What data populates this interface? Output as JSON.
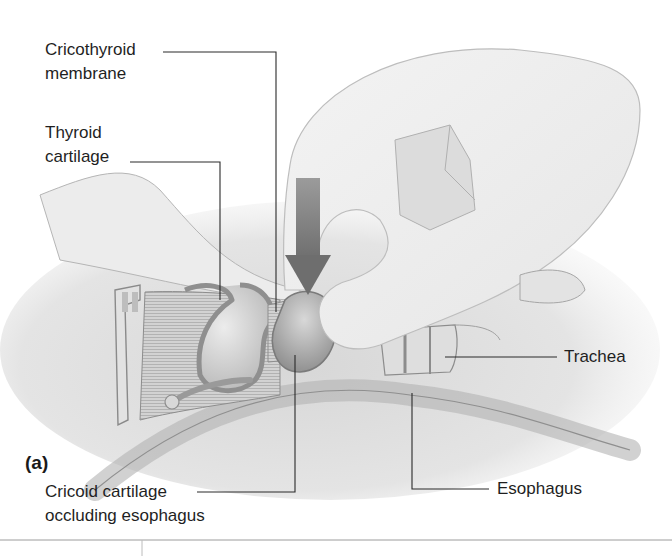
{
  "figure": {
    "panel_label": "(a)",
    "colors": {
      "ink": "#1f1f1f",
      "tissue_light": "#e6e6e6",
      "tissue_mid": "#c9c9c9",
      "tissue_dark": "#9a9a9a",
      "arrow": "#8a8a8a",
      "divider": "#9c9c9c"
    }
  },
  "labels": {
    "cricothyroid": {
      "line1": "Cricothyroid",
      "line2": "membrane"
    },
    "thyroid": {
      "line1": "Thyroid",
      "line2": "cartilage"
    },
    "trachea": {
      "line1": "Trachea"
    },
    "esophagus": {
      "line1": "Esophagus"
    },
    "cricoid": {
      "line1": "Cricoid cartilage",
      "line2": "occluding esophagus"
    }
  },
  "icons": {
    "pressure_arrow": "down-arrow-icon"
  }
}
